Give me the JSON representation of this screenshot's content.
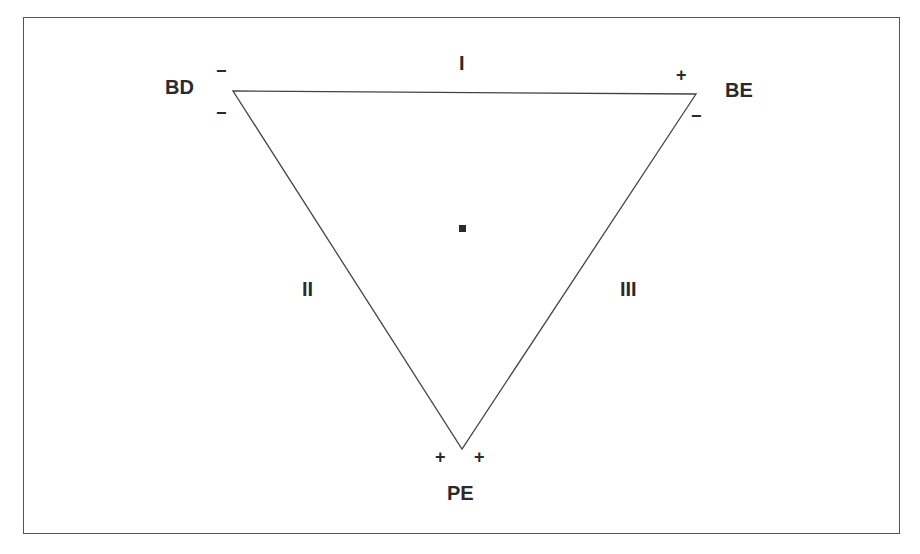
{
  "diagram": {
    "vertices": {
      "top_left": {
        "label": "BD",
        "signs": [
          "−",
          "−"
        ]
      },
      "top_right": {
        "label": "BE",
        "signs": [
          "+",
          "−"
        ]
      },
      "bottom": {
        "label": "PE",
        "signs": [
          "+",
          "+"
        ]
      }
    },
    "sides": {
      "top": "I",
      "left": "II",
      "right": "III"
    },
    "center_marker": "point",
    "line_color": "#444444",
    "text_color": "#2a2a2a"
  }
}
